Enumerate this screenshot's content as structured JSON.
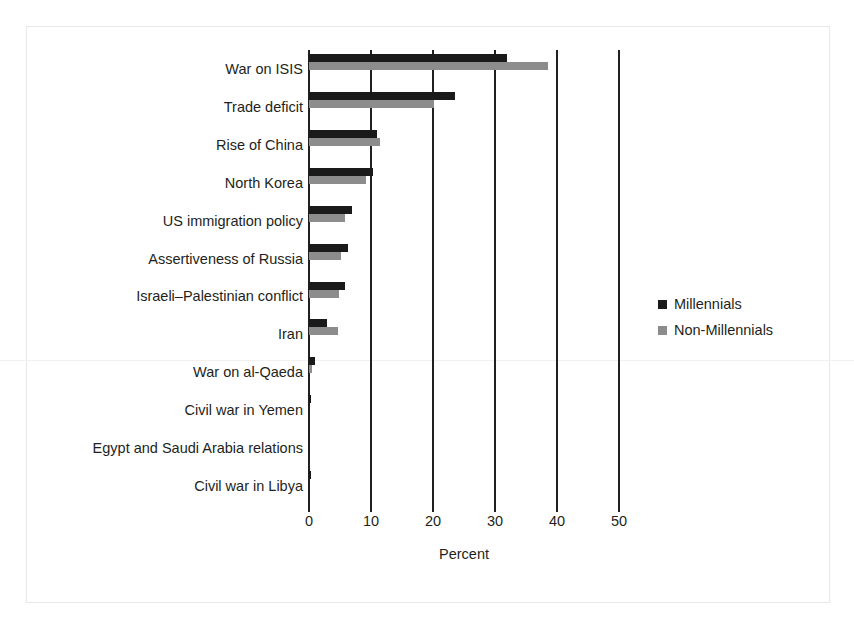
{
  "chart_data": {
    "type": "bar",
    "orientation": "horizontal",
    "title": "",
    "xlabel": "Percent",
    "ylabel": "",
    "xlim": [
      0,
      50
    ],
    "xticks": [
      0,
      10,
      20,
      30,
      40,
      50
    ],
    "xtick_labels": [
      "0",
      "10",
      "20",
      "30",
      "40",
      "50"
    ],
    "grid": true,
    "grid_axis": "x",
    "legend_position": "center right",
    "categories": [
      "War on ISIS",
      "Trade deficit",
      "Rise of China",
      "North Korea",
      "US immigration policy",
      "Assertiveness of Russia",
      "Israeli–Palestinian conflict",
      "Iran",
      "War on al-Qaeda",
      "Civil war in Yemen",
      "Egypt and Saudi Arabia relations",
      "Civil war in Libya"
    ],
    "series": [
      {
        "name": "Millennials",
        "color": "#1a1a1a",
        "values": [
          31.9,
          23.5,
          10.9,
          10.3,
          7.0,
          6.3,
          5.8,
          2.9,
          1.0,
          0.4,
          0.0,
          0.4
        ]
      },
      {
        "name": "Non-Millennials",
        "color": "#8c8c8c",
        "values": [
          38.6,
          20.2,
          11.5,
          9.2,
          5.8,
          5.2,
          4.9,
          4.7,
          0.5,
          0.0,
          0.0,
          0.0
        ]
      }
    ]
  },
  "axis": {
    "xlabel": "Percent"
  },
  "legend": {
    "items": [
      {
        "label": "Millennials",
        "color": "#1a1a1a"
      },
      {
        "label": "Non-Millennials",
        "color": "#8c8c8c"
      }
    ]
  },
  "colors": {
    "millennials": "#1a1a1a",
    "non_millennials": "#8c8c8c",
    "axis": "#231f20",
    "background": "#ffffff"
  }
}
